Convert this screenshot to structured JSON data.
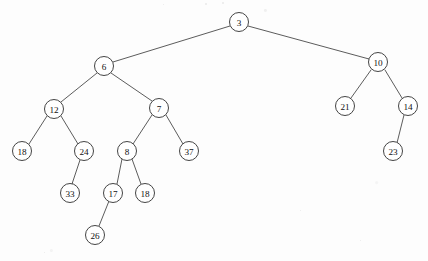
{
  "diagram": {
    "type": "binary-tree",
    "background_color": "#fdfdfd",
    "node_fill_color": "#ffffff",
    "node_stroke_color": "#3a3a3a",
    "edge_color": "#4a4a4a",
    "label_color": "#111111",
    "node_radius": 9.5,
    "nodes": [
      {
        "id": "n3",
        "label": "3",
        "x": 239,
        "y": 22,
        "r": 9.5
      },
      {
        "id": "n6",
        "label": "6",
        "x": 104,
        "y": 66,
        "r": 9.5
      },
      {
        "id": "n10",
        "label": "10",
        "x": 378,
        "y": 62,
        "r": 9.5
      },
      {
        "id": "n12",
        "label": "12",
        "x": 54,
        "y": 109,
        "r": 9.5
      },
      {
        "id": "n7",
        "label": "7",
        "x": 159,
        "y": 108,
        "r": 9.5
      },
      {
        "id": "n21",
        "label": "21",
        "x": 345,
        "y": 106,
        "r": 9.5
      },
      {
        "id": "n14",
        "label": "14",
        "x": 408,
        "y": 106,
        "r": 9.5
      },
      {
        "id": "n18a",
        "label": "18",
        "x": 22,
        "y": 151,
        "r": 9.5
      },
      {
        "id": "n24",
        "label": "24",
        "x": 84,
        "y": 151,
        "r": 9.5
      },
      {
        "id": "n8",
        "label": "8",
        "x": 127,
        "y": 151,
        "r": 9.5
      },
      {
        "id": "n37",
        "label": "37",
        "x": 189,
        "y": 151,
        "r": 9.5
      },
      {
        "id": "n23",
        "label": "23",
        "x": 393,
        "y": 151,
        "r": 9.5
      },
      {
        "id": "n33",
        "label": "33",
        "x": 70,
        "y": 193,
        "r": 9.5
      },
      {
        "id": "n17",
        "label": "17",
        "x": 113,
        "y": 193,
        "r": 9.5
      },
      {
        "id": "n18b",
        "label": "18",
        "x": 145,
        "y": 193,
        "r": 9.5
      },
      {
        "id": "n26",
        "label": "26",
        "x": 95,
        "y": 235,
        "r": 9.5
      }
    ],
    "edges": [
      {
        "id": "e-3-6",
        "from": "n3",
        "to": "n6",
        "x1": 230,
        "y1": 26,
        "x2": 113,
        "y2": 62
      },
      {
        "id": "e-3-10",
        "from": "n3",
        "to": "n10",
        "x1": 248,
        "y1": 26,
        "x2": 369,
        "y2": 59
      },
      {
        "id": "e-6-12",
        "from": "n6",
        "to": "n12",
        "x1": 97,
        "y1": 73,
        "x2": 61,
        "y2": 102
      },
      {
        "id": "e-6-7",
        "from": "n6",
        "to": "n7",
        "x1": 111,
        "y1": 73,
        "x2": 152,
        "y2": 101
      },
      {
        "id": "e-12-18",
        "from": "n12",
        "to": "n18a",
        "x1": 47,
        "y1": 116,
        "x2": 29,
        "y2": 144
      },
      {
        "id": "e-12-24",
        "from": "n12",
        "to": "n24",
        "x1": 61,
        "y1": 116,
        "x2": 78,
        "y2": 144
      },
      {
        "id": "e-7-8",
        "from": "n7",
        "to": "n8",
        "x1": 152,
        "y1": 115,
        "x2": 133,
        "y2": 144
      },
      {
        "id": "e-7-37",
        "from": "n7",
        "to": "n37",
        "x1": 166,
        "y1": 115,
        "x2": 183,
        "y2": 144
      },
      {
        "id": "e-24-33",
        "from": "n24",
        "to": "n33",
        "x1": 80,
        "y1": 160,
        "x2": 72,
        "y2": 184
      },
      {
        "id": "e-8-17",
        "from": "n8",
        "to": "n17",
        "x1": 122,
        "y1": 159,
        "x2": 117,
        "y2": 184
      },
      {
        "id": "e-8-18",
        "from": "n8",
        "to": "n18b",
        "x1": 132,
        "y1": 159,
        "x2": 141,
        "y2": 184
      },
      {
        "id": "e-17-26",
        "from": "n17",
        "to": "n26",
        "x1": 109,
        "y1": 201,
        "x2": 99,
        "y2": 226
      },
      {
        "id": "e-10-21",
        "from": "n10",
        "to": "n21",
        "x1": 371,
        "y1": 70,
        "x2": 351,
        "y2": 98
      },
      {
        "id": "e-10-14",
        "from": "n10",
        "to": "n14",
        "x1": 385,
        "y1": 70,
        "x2": 402,
        "y2": 98
      },
      {
        "id": "e-14-23",
        "from": "n14",
        "to": "n23",
        "x1": 404,
        "y1": 115,
        "x2": 397,
        "y2": 143
      }
    ],
    "artifacts": [
      {
        "id": "a1",
        "x": 205,
        "y": 3,
        "size": 2
      },
      {
        "id": "a2",
        "x": 222,
        "y": 2,
        "size": 2
      },
      {
        "id": "a3",
        "x": 163,
        "y": 4,
        "size": 1
      },
      {
        "id": "a4",
        "x": 44,
        "y": 252,
        "size": 1
      },
      {
        "id": "a5",
        "x": 300,
        "y": 210,
        "size": 1
      },
      {
        "id": "a6",
        "x": 360,
        "y": 240,
        "size": 1
      }
    ]
  }
}
